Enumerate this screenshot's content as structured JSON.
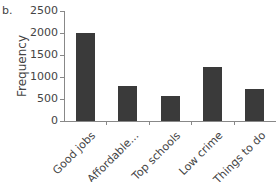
{
  "panel_label": "b.",
  "chart_data": {
    "type": "bar",
    "title": "",
    "xlabel": "",
    "ylabel": "Frequency",
    "categories": [
      "Good jobs",
      "Affordable...",
      "Top schools",
      "Low crime",
      "Things to do"
    ],
    "values": [
      2000,
      800,
      575,
      1225,
      725
    ],
    "ylim": [
      0,
      2500
    ],
    "yticks": [
      "0",
      "500",
      "1000",
      "1500",
      "2000",
      "2500"
    ],
    "grid": false,
    "legend": null,
    "bar_color": "#3a3a3a"
  }
}
